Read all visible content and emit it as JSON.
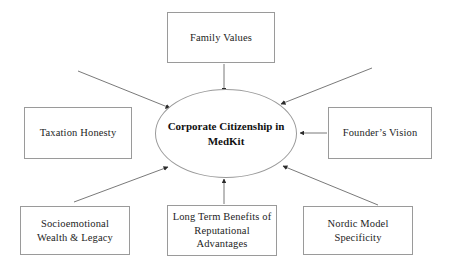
{
  "diagram": {
    "type": "hub-and-spoke",
    "center": {
      "id": "corporate-citizenship",
      "label": "Corporate Citizenship in MedKit",
      "shape": "ellipse"
    },
    "nodes": [
      {
        "id": "family-values",
        "label": "Family Values",
        "position": "top"
      },
      {
        "id": "taxation-honesty",
        "label": "Taxation Honesty",
        "position": "left"
      },
      {
        "id": "founders-vision",
        "label": "Founder’s Vision",
        "position": "right"
      },
      {
        "id": "socioemotional",
        "label": "Socioemotional Wealth & Legacy",
        "position": "bottom-left"
      },
      {
        "id": "long-term",
        "label": "Long Term Benefits of Reputational Advantages",
        "position": "bottom-center"
      },
      {
        "id": "nordic-model",
        "label": "Nordic Model Specificity",
        "position": "bottom-right"
      }
    ],
    "edges": [
      {
        "from": "family-values",
        "to": "corporate-citizenship",
        "style": "arrow"
      },
      {
        "from": "founders-vision",
        "to": "corporate-citizenship",
        "style": "arrow"
      },
      {
        "from": "socioemotional",
        "to": "corporate-citizenship",
        "style": "arrow"
      },
      {
        "from": "long-term",
        "to": "corporate-citizenship",
        "style": "arrow"
      },
      {
        "from": "nordic-model",
        "to": "corporate-citizenship",
        "style": "arrow"
      },
      {
        "from": "upper-left",
        "to": "corporate-citizenship",
        "style": "arrow"
      },
      {
        "from": "upper-right",
        "to": "corporate-citizenship",
        "style": "arrow"
      }
    ],
    "colors": {
      "background": "#ffffff",
      "box_border": "#9a9a9a",
      "ellipse_border": "#9a9a9a",
      "text": "#1d1d1d",
      "arrow": "#4a4a4a"
    }
  }
}
